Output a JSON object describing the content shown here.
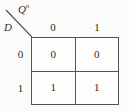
{
  "table": {
    "kind": "state-transition-table",
    "corner": {
      "diagonal_icon": "diagonal-divider-icon",
      "column_variable": "Q",
      "column_variable_superscript": "n",
      "row_variable": "D"
    },
    "column_headers": [
      "0",
      "1"
    ],
    "row_headers": [
      "0",
      "1"
    ],
    "rows": [
      {
        "label": "0",
        "cells": [
          "0",
          "0"
        ]
      },
      {
        "label": "1",
        "cells": [
          "1",
          "1"
        ]
      }
    ],
    "colors": {
      "background": "#fbfbfa",
      "cell_background": "#fdfdfc",
      "border": "#545454",
      "text": "#2b2b2b",
      "diagonal": "#4a4a4a"
    }
  }
}
